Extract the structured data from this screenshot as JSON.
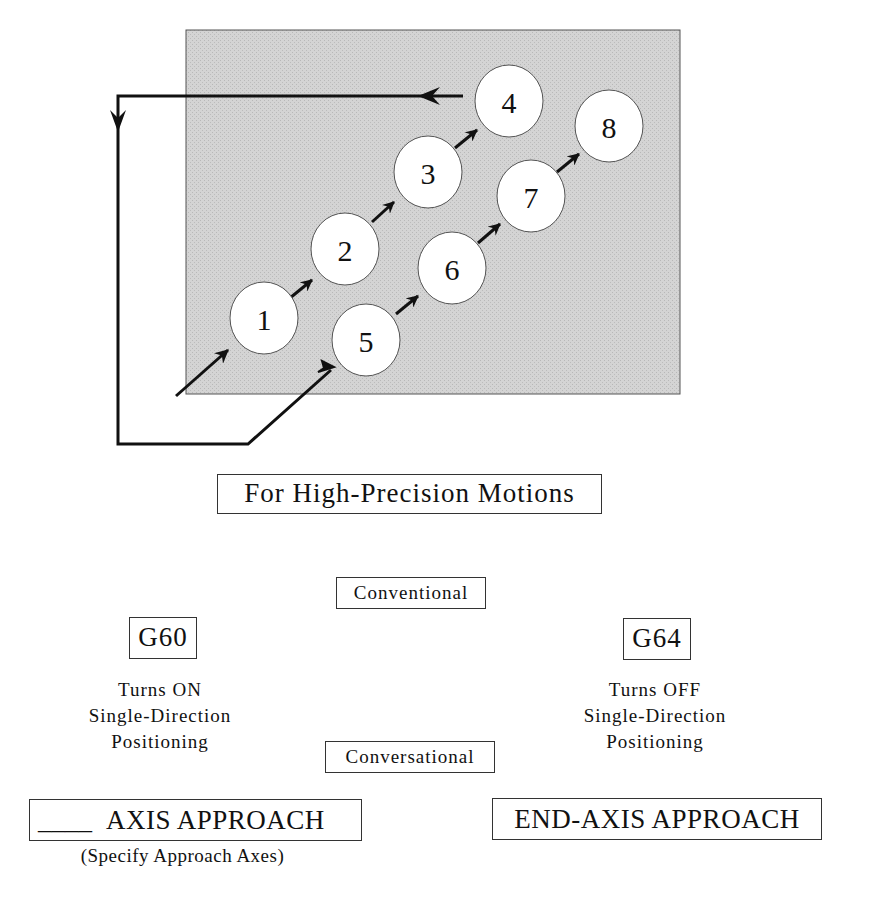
{
  "diagram": {
    "workpiece": {
      "x": 186,
      "y": 30,
      "width": 494,
      "height": 364,
      "fill": "#d2d2d2",
      "stroke": "#555555"
    },
    "holes": [
      {
        "label": "1",
        "cx": 264,
        "cy": 318,
        "r": 35
      },
      {
        "label": "2",
        "cx": 345,
        "cy": 249,
        "r": 35
      },
      {
        "label": "3",
        "cx": 428,
        "cy": 172,
        "r": 35
      },
      {
        "label": "4",
        "cx": 509,
        "cy": 102,
        "r": 35
      },
      {
        "label": "5",
        "cx": 366,
        "cy": 340,
        "r": 35
      },
      {
        "label": "6",
        "cx": 452,
        "cy": 268,
        "r": 35
      },
      {
        "label": "7",
        "cx": 531,
        "cy": 196,
        "r": 35
      },
      {
        "label": "8",
        "cx": 609,
        "cy": 126,
        "r": 35
      }
    ],
    "path_description": "Approach 1→2→3→4, return left along top, down left side, along bottom, then approach 5→6→7→8"
  },
  "caption": "For High-Precision Motions",
  "modes": {
    "conventional": "Conventional",
    "conversational": "Conversational"
  },
  "codes": {
    "g60": {
      "code": "G60",
      "description": "Turns ON\nSingle-Direction\nPositioning"
    },
    "g64": {
      "code": "G64",
      "description": "Turns OFF\nSingle-Direction\nPositioning"
    }
  },
  "conversational_commands": {
    "axis_approach": {
      "blank": "____",
      "label": "AXIS APPROACH",
      "note": "(Specify Approach Axes)"
    },
    "end_axis_approach": {
      "label": "END-AXIS APPROACH"
    }
  },
  "colors": {
    "line": "#111111",
    "workpiece": "#d2d2d2",
    "hole": "#ffffff"
  }
}
